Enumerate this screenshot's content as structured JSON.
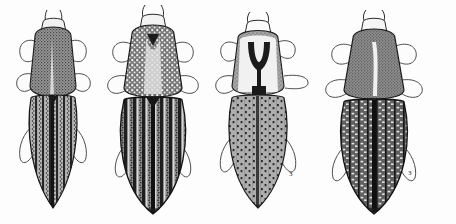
{
  "plate": {
    "kind": "scientific-illustration-plate",
    "subject": "click beetles (Elateridae), dorsal view",
    "style": "stippled pen-and-ink line drawing, grayscale",
    "background_color": "#fdfdfd",
    "ink_color": "#1d1d1d",
    "width_px": 456,
    "height_px": 224,
    "figure_count": 4,
    "caption": ""
  },
  "figures": [
    {
      "index": 1,
      "label": "",
      "position": {
        "x": 14,
        "y": 10,
        "w": 100,
        "h": 205
      },
      "body": {
        "x": 22,
        "y": 20,
        "w": 62,
        "h": 188
      },
      "head": {
        "shade": "#ededed",
        "band": "#3b3b3b"
      },
      "pronotum": {
        "shade": "#8d8d8d",
        "texture": "dense fine stipple",
        "midline": "pale median stripe",
        "shape": "bell-shaped, widest at base"
      },
      "elytra": {
        "shade": "#6f6f6f",
        "texture": "longitudinal striae of dark punctures",
        "stria_count": 9,
        "apex": "narrowly rounded, dark"
      },
      "legs": 6,
      "antennae": 2
    },
    {
      "index": 2,
      "label": "",
      "position": {
        "x": 108,
        "y": 6,
        "w": 110,
        "h": 212
      },
      "body": {
        "x": 118,
        "y": 12,
        "w": 80,
        "h": 203
      },
      "head": {
        "shade": "#f2f2f2",
        "band": "#343434"
      },
      "pronotum": {
        "shade": "#7b7b7b",
        "texture": "coarse white-speckled granulate",
        "midline": "pale V-shaped median area",
        "shape": "broad, lateral margins granulate"
      },
      "elytra": {
        "shade": "#5f5f5f",
        "texture": "broad dark striae with pale interstices",
        "stria_count": 9,
        "apex": "broadly rounded, dark"
      },
      "legs": 6,
      "antennae": 2
    },
    {
      "index": 3,
      "label": "3",
      "position": {
        "x": 214,
        "y": 14,
        "w": 106,
        "h": 200
      },
      "body": {
        "x": 226,
        "y": 24,
        "w": 74,
        "h": 186
      },
      "head": {
        "shade": "#fafafa",
        "band": "#2e2e2e"
      },
      "pronotum": {
        "shade": "#9f9f9f",
        "texture": "pale with bold dark Y-shaped marking",
        "midline": "dark Y / trident mark",
        "shape": "subquadrate with rounded sides"
      },
      "elytra": {
        "shade": "#a2a2a2",
        "texture": "rows of small square punctures on pale ground",
        "stria_count": 9,
        "apex": "rounded, darkened"
      },
      "legs": 6,
      "antennae": 2,
      "figure_number": "3"
    },
    {
      "index": 4,
      "label": "3",
      "position": {
        "x": 324,
        "y": 12,
        "w": 116,
        "h": 204
      },
      "body": {
        "x": 336,
        "y": 22,
        "w": 84,
        "h": 192
      },
      "head": {
        "shade": "#f4f4f4",
        "band": "#343434"
      },
      "pronotum": {
        "shade": "#8a8a8a",
        "texture": "even fine stipple",
        "midline": "narrow pale median line",
        "shape": "bell-shaped, broad hind angles"
      },
      "elytra": {
        "shade": "#5b5b5b",
        "texture": "rows of coarse pale dashes between dark striae",
        "stria_count": 9,
        "apex": "rounded, dark"
      },
      "legs": 6,
      "antennae": 2,
      "figure_number": "3"
    }
  ],
  "annotations": [
    {
      "text": "3",
      "x": 289,
      "y": 171
    },
    {
      "text": "3",
      "x": 408,
      "y": 172
    }
  ]
}
